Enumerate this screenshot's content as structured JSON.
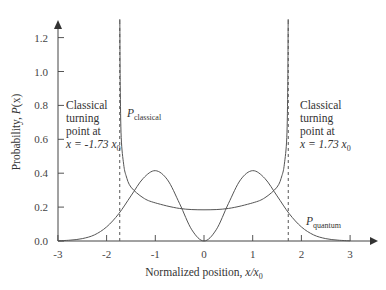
{
  "chart_data": {
    "type": "line",
    "title": "",
    "xlabel": "Normalized position, x/x0",
    "ylabel": "Probability, P(x)",
    "xlim": [
      -3,
      3
    ],
    "ylim": [
      0,
      1.3
    ],
    "grid": false,
    "x_ticks": [
      "-3",
      "-2",
      "-1",
      "0",
      "1",
      "2",
      "3"
    ],
    "y_ticks": [
      "0.0",
      "0.2",
      "0.4",
      "0.6",
      "0.8",
      "1.0",
      "1.2"
    ],
    "series": [
      {
        "name": "P_quantum",
        "x": [
          0,
          0.25,
          0.5,
          0.75,
          1,
          1.25,
          1.5,
          1.75,
          2,
          2.25,
          2.5,
          2.75,
          3
        ],
        "values": [
          0,
          0.066,
          0.22,
          0.361,
          0.415,
          0.369,
          0.266,
          0.161,
          0.083,
          0.036,
          0.014,
          0.005,
          0.001
        ],
        "symmetric": true
      },
      {
        "name": "P_classical",
        "x": [
          0,
          0.5,
          1,
          1.25,
          1.5,
          1.6,
          1.65,
          1.7,
          1.72,
          1.728,
          1.731
        ],
        "values": [
          0.184,
          0.192,
          0.225,
          0.255,
          0.318,
          0.385,
          0.453,
          0.611,
          0.919,
          1.6,
          3.0
        ],
        "symmetric": true
      }
    ],
    "vlines": [
      -1.73,
      1.73
    ],
    "annotations": {
      "left_turning": [
        "Classical",
        "turning",
        "point at",
        "x = -1.73 x",
        "0"
      ],
      "right_turning": [
        "Classical",
        "turning",
        "point at",
        "x = 1.73 x",
        "0"
      ],
      "p_classical": {
        "main": "P",
        "sub": "classical"
      },
      "p_quantum": {
        "main": "P",
        "sub": "quantum"
      }
    }
  },
  "axes": {
    "xlabel_main": "Normalized position, ",
    "xlabel_var": "x/x",
    "xlabel_sub": "0",
    "ylabel_main": "Probability, ",
    "ylabel_var": "P",
    "ylabel_paren": "(x)"
  }
}
